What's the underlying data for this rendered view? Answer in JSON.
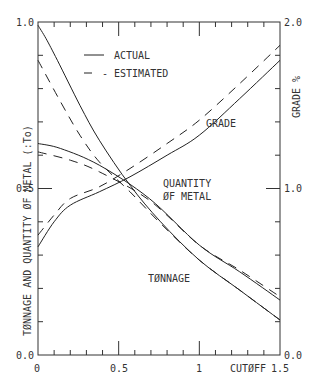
{
  "chart_data": {
    "type": "line",
    "title": "",
    "xlabel": "CUTØFF",
    "ylabel_left": "TØNNAGE AND QUANTITY ØF METAL (:To)",
    "ylabel_right": "GRADE %",
    "xlim": [
      0,
      1.5
    ],
    "ylim_left": [
      0.0,
      1.0
    ],
    "ylim_right": [
      0.0,
      2.0
    ],
    "grid": false,
    "legend": {
      "position": "upper-left-inside",
      "entries": [
        {
          "label": "ACTUAL",
          "style": "solid"
        },
        {
          "label": "- ESTIMATED",
          "style": "dashed"
        }
      ]
    },
    "x_ticks": [
      "0",
      "0.5",
      "1",
      "1.5"
    ],
    "y_ticks_left": [
      "0.0",
      "0.5",
      "1.0"
    ],
    "y_ticks_right": [
      "0.0",
      "1.0",
      "2.0"
    ],
    "annotations": [
      "GRADE",
      "QUANTITY",
      "ØF METAL",
      "TØNNAGE"
    ],
    "series": [
      {
        "name": "Tonnage (actual)",
        "axis": "left",
        "style": "solid",
        "x": [
          0,
          0.05,
          0.12,
          0.26,
          0.38,
          0.57,
          0.76,
          1.0,
          1.25,
          1.5
        ],
        "y": [
          0.99,
          0.95,
          0.885,
          0.75,
          0.645,
          0.51,
          0.4,
          0.285,
          0.195,
          0.105
        ]
      },
      {
        "name": "Tonnage (estimated)",
        "axis": "left",
        "style": "dashed",
        "x": [
          0,
          0.14,
          0.26,
          0.38,
          0.57,
          0.76,
          1.0,
          1.25,
          1.5
        ],
        "y": [
          0.885,
          0.76,
          0.66,
          0.58,
          0.49,
          0.395,
          0.285,
          0.195,
          0.105
        ]
      },
      {
        "name": "Quantity of metal (actual)",
        "axis": "left",
        "style": "solid",
        "x": [
          0,
          0.14,
          0.38,
          0.69,
          1.0,
          1.25,
          1.5
        ],
        "y": [
          0.635,
          0.62,
          0.57,
          0.47,
          0.33,
          0.25,
          0.165
        ]
      },
      {
        "name": "Quantity of metal (estimated)",
        "axis": "left",
        "style": "dashed",
        "x": [
          0,
          0.2,
          0.38,
          0.69,
          1.0,
          1.25,
          1.5
        ],
        "y": [
          0.61,
          0.585,
          0.55,
          0.465,
          0.33,
          0.255,
          0.175
        ]
      },
      {
        "name": "Grade (actual)",
        "axis": "right",
        "style": "solid",
        "x": [
          0,
          0.1,
          0.2,
          0.38,
          0.57,
          0.8,
          1.0,
          1.25,
          1.5
        ],
        "y": [
          0.65,
          0.8,
          0.9,
          0.98,
          1.07,
          1.2,
          1.32,
          1.54,
          1.77
        ]
      },
      {
        "name": "Grade (estimated)",
        "axis": "right",
        "style": "dashed",
        "x": [
          0,
          0.1,
          0.2,
          0.38,
          0.57,
          0.8,
          1.0,
          1.25,
          1.5
        ],
        "y": [
          0.72,
          0.84,
          0.94,
          1.01,
          1.12,
          1.27,
          1.41,
          1.63,
          1.86
        ]
      }
    ]
  },
  "labels": {
    "legend_actual": "ACTUAL",
    "legend_estimated": "- ESTIMATED",
    "grade": "GRADE",
    "quantity_line1": "QUANTITY",
    "quantity_line2": "ØF METAL",
    "tonnage": "TØNNAGE",
    "ylabel_left": "TØNNAGE AND QUANTITY ØF METAL (:To)",
    "ylabel_right": "GRADE %",
    "xlabel": "CUTØFF",
    "x0": "0",
    "x05": "0.5",
    "x1": "1",
    "x15": "1.5",
    "yl0": "0.0",
    "yl05": "0.5",
    "yl1": "1.0",
    "yr0": "0.0",
    "yr1": "1.0",
    "yr2": "2.0"
  }
}
